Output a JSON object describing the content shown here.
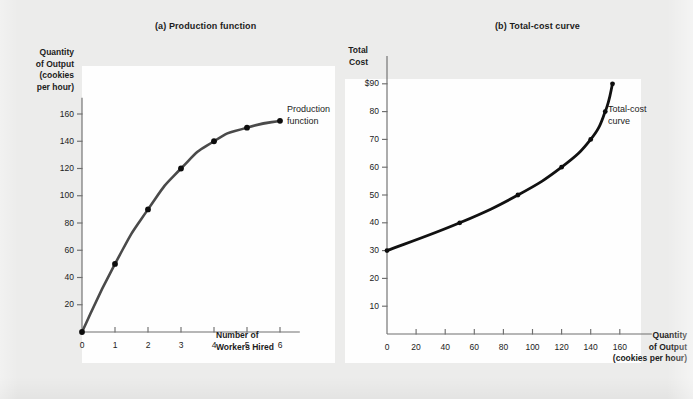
{
  "figure": {
    "background_color": "#ececeb",
    "plot_background_color": "#fefefe",
    "ink_color": "#1c1c1c"
  },
  "panels": [
    {
      "id": "production-function",
      "title": "(a) Production function",
      "curve_label_line1": "Production",
      "curve_label_line2": "function",
      "curve_color": "#4a4a4a",
      "y_axis_title": [
        "Quantity",
        "of Output",
        "(cookies",
        "per hour)"
      ],
      "x_axis_title": [
        "Number of",
        "Workers Hired"
      ]
    },
    {
      "id": "total-cost-curve",
      "title": "(b) Total-cost curve",
      "curve_label_line1": "Total-cost",
      "curve_label_line2": "curve",
      "curve_color": "#111111",
      "y_axis_title": [
        "Total",
        "Cost"
      ],
      "x_axis_title": [
        "Quantity",
        "of Output",
        "(cookies per hour)"
      ]
    }
  ],
  "chart_data": [
    {
      "type": "line",
      "title": "(a) Production function",
      "xlabel": "Number of Workers Hired",
      "ylabel": "Quantity of Output (cookies per hour)",
      "xlim": [
        0,
        6.6
      ],
      "ylim": [
        0,
        172
      ],
      "grid": false,
      "legend_position": "inline-right",
      "x_ticks": [
        0,
        1,
        2,
        3,
        4,
        5,
        6
      ],
      "x_tick_labels": [
        "0",
        "1",
        "2",
        "3",
        "4",
        "5",
        "6"
      ],
      "y_ticks": [
        20,
        40,
        60,
        80,
        100,
        120,
        140,
        160
      ],
      "y_tick_labels": [
        "20",
        "40",
        "60",
        "80",
        "100",
        "120",
        "140",
        "160"
      ],
      "series": [
        {
          "name": "Production function",
          "x": [
            0,
            1,
            2,
            3,
            4,
            5,
            6
          ],
          "values": [
            0,
            50,
            90,
            120,
            140,
            150,
            155
          ],
          "markers": true
        }
      ],
      "annotations": [
        "Production function"
      ]
    },
    {
      "type": "line",
      "title": "(b) Total-cost curve",
      "xlabel": "Quantity of Output (cookies per hour)",
      "ylabel": "Total Cost",
      "xlim": [
        0,
        182
      ],
      "ylim": [
        0,
        100
      ],
      "grid": false,
      "legend_position": "inline-right",
      "x_ticks": [
        0,
        20,
        40,
        60,
        80,
        100,
        120,
        140,
        160
      ],
      "x_tick_labels": [
        "0",
        "20",
        "40",
        "60",
        "80",
        "100",
        "120",
        "140",
        "160"
      ],
      "y_ticks": [
        10,
        20,
        30,
        40,
        50,
        60,
        70,
        80,
        90
      ],
      "y_tick_labels": [
        "10",
        "20",
        "30",
        "40",
        "50",
        "60",
        "70",
        "80",
        "$90"
      ],
      "series": [
        {
          "name": "Total-cost curve",
          "x": [
            0,
            50,
            90,
            120,
            140,
            150,
            155
          ],
          "values": [
            30,
            40,
            50,
            60,
            70,
            80,
            90
          ],
          "markers": true
        }
      ],
      "annotations": [
        "Total-cost curve"
      ]
    }
  ]
}
